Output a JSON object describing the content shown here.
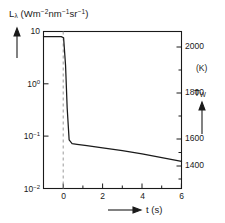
{
  "chart_data": {
    "type": "line",
    "title": "",
    "ylabel": "L",
    "ylabel_sub": "λ",
    "ylabel_units": "(Wm",
    "ylabel_units_full": "Lλ (Wm-2nm-1sr-1)",
    "xlabel": "t",
    "xlabel_units": "(s)",
    "yscale": "log",
    "xlim": [
      -1,
      6
    ],
    "ylim": [
      0.01,
      10
    ],
    "y_ticks": [
      "10",
      "10",
      "10",
      "10"
    ],
    "y_tick_exponents": [
      "",
      "0",
      "-1",
      "-2"
    ],
    "y_tick_values": [
      10,
      1,
      0.1,
      0.01
    ],
    "x_ticks": [
      "0",
      "2",
      "4",
      "6"
    ],
    "x_tick_values": [
      0,
      2,
      4,
      6
    ],
    "x_minor_ticks": [
      1,
      3,
      5
    ],
    "right_axis_label": "T",
    "right_axis_label_sub": "W",
    "right_axis_units": "(K)",
    "right_ticks": [
      "2000",
      "1800",
      "1600",
      "1400"
    ],
    "right_tick_values": [
      2000,
      1800,
      1600,
      1400
    ],
    "grid": false,
    "legend": null,
    "annotations": [
      {
        "name": "t-zero-dashed-line",
        "x": 0,
        "style": "dashed-vertical"
      }
    ],
    "series": [
      {
        "name": "spectral-radiance",
        "x": [
          -1.0,
          -0.1,
          0.02,
          0.12,
          0.2,
          0.3,
          0.45,
          0.7,
          1.2,
          2.0,
          3.0,
          4.0,
          5.0,
          6.0
        ],
        "y": [
          8.0,
          8.0,
          7.6,
          2.2,
          0.35,
          0.085,
          0.072,
          0.07,
          0.066,
          0.06,
          0.053,
          0.046,
          0.039,
          0.033
        ]
      }
    ]
  },
  "axis_markers": {
    "y_arrow": "up-arrow",
    "x_arrow": "right-arrow",
    "tw_arrow": "up-arrow"
  }
}
